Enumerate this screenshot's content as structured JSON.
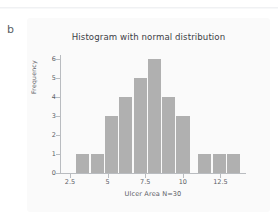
{
  "page": {
    "panel_letter": "b",
    "background": "#ffffff",
    "card_background": "#fafafa"
  },
  "chart_data": {
    "type": "bar",
    "title": "Histogram with normal distribution",
    "xlabel": "Ulcer Area N=30",
    "ylabel": "Frequency",
    "bar_color": "#b0b0b0",
    "axis_color": "#b9bcc0",
    "grid": false,
    "legend": null,
    "xlim": [
      1.9,
      14.2
    ],
    "ylim": [
      0,
      6.2
    ],
    "bin_width": 0.95,
    "categories": [
      "3.4",
      "4.35",
      "5.3",
      "6.25",
      "7.2",
      "8.15",
      "9.1",
      "10.05",
      "11.5",
      "12.45",
      "13.4"
    ],
    "bin_centers": [
      3.4,
      4.35,
      5.3,
      6.25,
      7.2,
      8.15,
      9.1,
      10.05,
      11.5,
      12.45,
      13.4
    ],
    "values": [
      1,
      1,
      3,
      4,
      5,
      6,
      4,
      3,
      1,
      1,
      1
    ],
    "xticks": [
      2.5,
      5,
      7.5,
      10,
      12.5
    ],
    "xtick_labels": [
      "2.5",
      "5",
      "7.5",
      "10",
      "12.5"
    ],
    "yticks": [
      0,
      1,
      2,
      3,
      4,
      5,
      6
    ],
    "ytick_labels": [
      "0",
      "1",
      "2",
      "3",
      "4",
      "5",
      "6"
    ],
    "n": 30
  }
}
